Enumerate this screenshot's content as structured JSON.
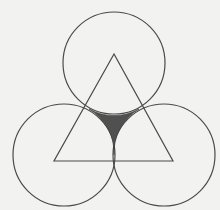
{
  "diagram": {
    "title": "",
    "background": "#f2f2f0",
    "line_color": "#4a4a4a",
    "shade_color": "#505050",
    "circles": [
      {
        "name": "top",
        "cx": 114,
        "cy": 63,
        "r": 51
      },
      {
        "name": "left",
        "cx": 64,
        "cy": 155,
        "r": 51
      },
      {
        "name": "right",
        "cx": 164,
        "cy": 155,
        "r": 51
      }
    ],
    "triangle": {
      "vertices": [
        [
          114,
          54
        ],
        [
          54,
          161
        ],
        [
          173,
          161
        ]
      ]
    },
    "shaded_region": {
      "description": "curvilinear region bounded by the three mutually tangent circles",
      "cusps": [
        [
          84,
          107
        ],
        [
          144,
          107
        ],
        [
          114,
          155
        ]
      ]
    },
    "labels": []
  }
}
